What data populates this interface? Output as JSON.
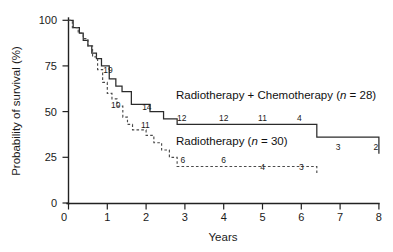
{
  "chart_data": {
    "type": "line",
    "title": "",
    "subtitle": "",
    "xlabel": "Years",
    "ylabel": "Probability of survival (%)",
    "xlim": [
      0,
      8
    ],
    "ylim": [
      0,
      100
    ],
    "xticks": [
      "0",
      "1",
      "2",
      "3",
      "4",
      "5",
      "6",
      "7",
      "8"
    ],
    "yticks": [
      "0",
      "25",
      "50",
      "75",
      "100"
    ],
    "grid": false,
    "legend_position": "inside-plot",
    "series": [
      {
        "name": "Radiotherapy + Chemotherapy (n = 28)",
        "label_text": "Radiotherapy + Chemotherapy",
        "label_n_prefix": "(",
        "label_n_italic": "n",
        "label_n_suffix": " = 28)",
        "style": "solid",
        "n": 28,
        "color": "#2b2b2b",
        "x": [
          0.0,
          0.12,
          0.28,
          0.38,
          0.5,
          0.6,
          0.72,
          0.85,
          1.05,
          1.22,
          1.38,
          1.62,
          1.8,
          2.1,
          2.45,
          2.8,
          6.0,
          6.4,
          8.0
        ],
        "y": [
          100,
          96,
          93,
          89,
          86,
          82,
          79,
          75,
          68,
          64,
          61,
          54,
          54,
          50,
          46,
          43,
          43,
          36,
          27
        ]
      },
      {
        "name": "Radiotherapy (n = 30)",
        "label_text": "Radiotherapy",
        "label_n_prefix": "(",
        "label_n_italic": "n",
        "label_n_suffix": " = 30)",
        "style": "dashed",
        "n": 30,
        "color": "#4a4a4a",
        "x": [
          0.0,
          0.1,
          0.25,
          0.38,
          0.5,
          0.62,
          0.75,
          0.88,
          1.0,
          1.12,
          1.25,
          1.4,
          1.52,
          1.65,
          1.8,
          2.0,
          2.2,
          2.4,
          2.6,
          2.8,
          4.5,
          6.4
        ],
        "y": [
          100,
          96,
          93,
          90,
          86,
          80,
          73,
          66,
          60,
          57,
          53,
          47,
          43,
          40,
          40,
          37,
          33,
          29,
          25,
          20,
          20,
          16
        ]
      }
    ],
    "risk_labels_solid": [
      {
        "text": "19",
        "x": 1.02,
        "y": 71
      },
      {
        "text": "10",
        "x": 1.22,
        "y": 52
      },
      {
        "text": "14",
        "x": 2.02,
        "y": 51
      },
      {
        "text": "12",
        "x": 2.92,
        "y": 45
      },
      {
        "text": "12",
        "x": 4.0,
        "y": 45
      },
      {
        "text": "11",
        "x": 5.0,
        "y": 45
      },
      {
        "text": "4",
        "x": 5.95,
        "y": 45
      },
      {
        "text": "3",
        "x": 6.95,
        "y": 29
      },
      {
        "text": "2",
        "x": 7.92,
        "y": 29
      }
    ],
    "risk_labels_dashed": [
      {
        "text": "11",
        "x": 1.98,
        "y": 41
      },
      {
        "text": "6",
        "x": 2.95,
        "y": 22
      },
      {
        "text": "6",
        "x": 4.0,
        "y": 22
      },
      {
        "text": "4",
        "x": 5.0,
        "y": 18
      },
      {
        "text": "3",
        "x": 6.0,
        "y": 18
      }
    ]
  },
  "figure": {
    "axis_color": "#222222",
    "background": "#ffffff"
  }
}
